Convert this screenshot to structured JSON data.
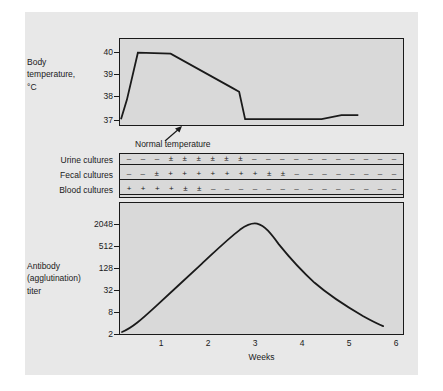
{
  "figure": {
    "caption_present": false
  },
  "temperature": {
    "axis_title_lines": [
      "Body",
      "temperature,",
      "°C"
    ],
    "ytick_labels": [
      "40",
      "39",
      "38",
      "37"
    ],
    "annotation": "Normal temperature"
  },
  "cultures": {
    "rows": [
      {
        "name": "Urine cultures",
        "symbols": [
          "–",
          "–",
          "–",
          "±",
          "±",
          "±",
          "±",
          "±",
          "±",
          "–",
          "–",
          "–",
          "–",
          "–",
          "–",
          "–",
          "–",
          "–",
          "–",
          "–"
        ]
      },
      {
        "name": "Fecal cultures",
        "symbols": [
          "–",
          "–",
          "±",
          "+",
          "+",
          "+",
          "+",
          "+",
          "+",
          "+",
          "±",
          "±",
          "–",
          "–",
          "–",
          "–",
          "–",
          "–",
          "–",
          "–"
        ]
      },
      {
        "name": "Blood cultures",
        "symbols": [
          "+",
          "+",
          "+",
          "+",
          "±",
          "±",
          "–",
          "–",
          "–",
          "–",
          "–",
          "–",
          "–",
          "–",
          "–",
          "–",
          "–",
          "–",
          "–",
          "–"
        ]
      }
    ]
  },
  "antibody": {
    "axis_title_lines": [
      "Antibody",
      "(agglutination)",
      "titer"
    ],
    "ytick_labels": [
      "2048",
      "512",
      "128",
      "32",
      "8",
      "2"
    ],
    "xtick_labels": [
      "1",
      "2",
      "3",
      "4",
      "5",
      "6"
    ],
    "xlabel": "Weeks"
  },
  "colors": {
    "page_background": "#ffffff",
    "figure_background": "#e8e8e8",
    "panel_background": "#d9d9d9",
    "ink": "#1a1a1a"
  },
  "chart_data": [
    {
      "type": "line",
      "title": "Body temperature",
      "xlabel": "Weeks",
      "ylabel": "Body temperature, °C",
      "xlim": [
        0,
        6
      ],
      "ylim": [
        36.85,
        40.45
      ],
      "yticks": [
        37,
        38,
        39,
        40
      ],
      "grid": false,
      "legend": null,
      "annotations": [
        {
          "text": "Normal temperature",
          "points_to_y": 37,
          "points_to_x": 1.15
        }
      ],
      "series": [
        {
          "name": "Body temperature",
          "x": [
            0.0,
            0.12,
            0.35,
            1.05,
            2.35,
            2.5,
            2.62,
            3.3,
            4.2,
            4.6,
            4.9
          ],
          "y": [
            37.0,
            37.9,
            39.8,
            39.75,
            38.2,
            38.05,
            37.0,
            37.0,
            37.0,
            37.15,
            37.15
          ]
        }
      ]
    },
    {
      "type": "table",
      "title": "Cultures",
      "xlabel": "Weeks",
      "columns": 20,
      "row_names": [
        "Urine cultures",
        "Fecal cultures",
        "Blood cultures"
      ],
      "values": [
        [
          "–",
          "–",
          "–",
          "±",
          "±",
          "±",
          "±",
          "±",
          "±",
          "–",
          "–",
          "–",
          "–",
          "–",
          "–",
          "–",
          "–",
          "–",
          "–",
          "–"
        ],
        [
          "–",
          "–",
          "±",
          "+",
          "+",
          "+",
          "+",
          "+",
          "+",
          "+",
          "±",
          "±",
          "–",
          "–",
          "–",
          "–",
          "–",
          "–",
          "–",
          "–"
        ],
        [
          "+",
          "+",
          "+",
          "+",
          "±",
          "±",
          "–",
          "–",
          "–",
          "–",
          "–",
          "–",
          "–",
          "–",
          "–",
          "–",
          "–",
          "–",
          "–",
          "–"
        ]
      ]
    },
    {
      "type": "line",
      "title": "Antibody (agglutination) titer",
      "xlabel": "Weeks",
      "ylabel": "Antibody (agglutination) titer",
      "yscale": "log4",
      "xlim": [
        0,
        6
      ],
      "ylim": [
        1.6,
        4096
      ],
      "yticks": [
        2,
        8,
        32,
        128,
        512,
        2048
      ],
      "xticks": [
        1,
        2,
        3,
        4,
        5,
        6
      ],
      "grid": false,
      "legend": null,
      "series": [
        {
          "name": "Agglutination titer",
          "x": [
            0.05,
            0.4,
            0.8,
            1.2,
            1.6,
            2.0,
            2.4,
            2.85,
            3.3,
            3.8,
            4.3,
            4.9,
            5.4,
            5.8
          ],
          "y": [
            1.8,
            4,
            10,
            26,
            64,
            160,
            560,
            2600,
            1700,
            760,
            330,
            120,
            45,
            14
          ]
        }
      ]
    }
  ]
}
